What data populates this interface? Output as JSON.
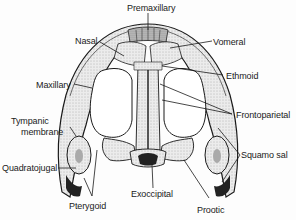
{
  "diagram": {
    "labels": {
      "premaxillary": "Premaxillary",
      "nasal": "Nasal",
      "vomeral": "Vomeral",
      "maxillary": "Maxillary",
      "ethmoid": "Ethmoid",
      "frontoparietal": "Frontoparietal",
      "tympanic_line1": "Tympanic",
      "tympanic_line2": "membrane",
      "quadratojugal": "Quadratojugal",
      "squamosal": "Squamo sal",
      "pterygoid": "Pterygoid",
      "exoccipital": "Exoccipital",
      "prootic": "Prootic"
    },
    "colors": {
      "ink": "#1a1a1a",
      "bone_fill": "#e6e6e6",
      "bone_dark": "#9a9a9a",
      "background": "#fdfdfd"
    }
  }
}
